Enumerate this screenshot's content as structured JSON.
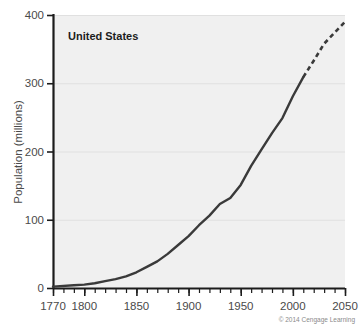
{
  "figure": {
    "series_label": "United States",
    "credit": "© 2014 Cengage Learning"
  },
  "colors": {
    "plot_background": "#f0f0f0",
    "page_background": "#ffffff",
    "axis": "#1c1c1c",
    "gridline": "#e0e0e0",
    "line_historical": "#3a3a3a",
    "line_projected": "#3a3a3a",
    "tick_text": "#4a4a4a",
    "credit_text": "#8a8a8a"
  },
  "chart_data": {
    "type": "line",
    "title": "United States",
    "xlabel": "",
    "ylabel": "Population (millions)",
    "xlim": [
      1770,
      2050
    ],
    "ylim": [
      0,
      400
    ],
    "grid": true,
    "legend_position": "none",
    "x_ticks": [
      1770,
      1800,
      1850,
      1900,
      1950,
      2000,
      2050
    ],
    "x_tick_labels": [
      "1770",
      "1800",
      "1850",
      "1900",
      "1950",
      "2000",
      "2050"
    ],
    "x_minor_tick_interval": 10,
    "y_ticks": [
      0,
      100,
      200,
      300,
      400
    ],
    "y_tick_labels": [
      "0",
      "100",
      "200",
      "300",
      "400"
    ],
    "series": [
      {
        "name": "United States",
        "style": "solid",
        "note": "historical",
        "x": [
          1770,
          1790,
          1800,
          1810,
          1820,
          1830,
          1840,
          1850,
          1860,
          1870,
          1880,
          1890,
          1900,
          1910,
          1920,
          1930,
          1940,
          1950,
          1960,
          1970,
          1980,
          1990,
          2000,
          2010
        ],
        "values": [
          2,
          4,
          5,
          7,
          10,
          13,
          17,
          23,
          31,
          39,
          50,
          63,
          76,
          92,
          106,
          123,
          132,
          151,
          179,
          203,
          227,
          249,
          281,
          309
        ]
      },
      {
        "name": "United States (projected)",
        "style": "dashed",
        "note": "projection",
        "x": [
          2010,
          2020,
          2030,
          2040,
          2050
        ],
        "values": [
          309,
          333,
          358,
          374,
          390
        ]
      }
    ]
  }
}
